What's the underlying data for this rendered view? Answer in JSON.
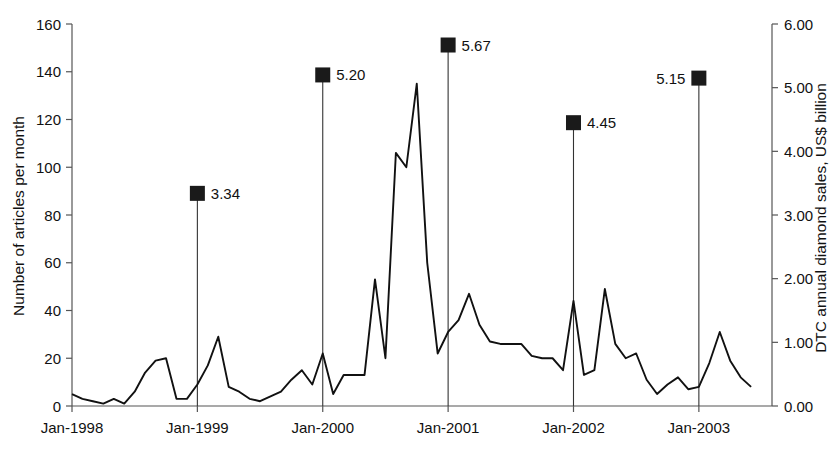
{
  "chart_data": {
    "type": "line",
    "title": "",
    "xlabel": "",
    "ylabel": "Number of articles per month",
    "y2label": "DTC annual diamond sales, US$ billion",
    "grid": false,
    "legend": "none",
    "xlim": [
      "Jan-1998",
      "Jul-2003"
    ],
    "ylim": [
      0,
      160
    ],
    "y2lim": [
      0,
      6.0
    ],
    "yticks": [
      0,
      20,
      40,
      60,
      80,
      100,
      120,
      140,
      160
    ],
    "ytick_labels": [
      "0",
      "20",
      "40",
      "60",
      "80",
      "100",
      "120",
      "140",
      "160"
    ],
    "y2ticks": [
      0.0,
      1.0,
      2.0,
      3.0,
      4.0,
      5.0,
      6.0
    ],
    "y2tick_labels": [
      "0.00",
      "1.00",
      "2.00",
      "3.00",
      "4.00",
      "5.00",
      "6.00"
    ],
    "xtick_labels": [
      "Jan-1998",
      "Jan-1999",
      "Jan-2000",
      "Jan-2001",
      "Jan-2002",
      "Jan-2003"
    ],
    "xtick_indices": [
      0,
      12,
      24,
      36,
      48,
      60
    ],
    "series": [
      {
        "name": "Number of articles per month",
        "axis": "left",
        "style": "line",
        "x": [
          "Jan-1998",
          "Feb-1998",
          "Mar-1998",
          "Apr-1998",
          "May-1998",
          "Jun-1998",
          "Jul-1998",
          "Aug-1998",
          "Sep-1998",
          "Oct-1998",
          "Nov-1998",
          "Dec-1998",
          "Jan-1999",
          "Feb-1999",
          "Mar-1999",
          "Apr-1999",
          "May-1999",
          "Jun-1999",
          "Jul-1999",
          "Aug-1999",
          "Sep-1999",
          "Oct-1999",
          "Nov-1999",
          "Dec-1999",
          "Jan-2000",
          "Feb-2000",
          "Mar-2000",
          "Apr-2000",
          "May-2000",
          "Jun-2000",
          "Jul-2000",
          "Aug-2000",
          "Sep-2000",
          "Oct-2000",
          "Nov-2000",
          "Dec-2000",
          "Jan-2001",
          "Feb-2001",
          "Mar-2001",
          "Apr-2001",
          "May-2001",
          "Jun-2001",
          "Jul-2001",
          "Aug-2001",
          "Sep-2001",
          "Oct-2001",
          "Nov-2001",
          "Dec-2001",
          "Jan-2002",
          "Feb-2002",
          "Mar-2002",
          "Apr-2002",
          "May-2002",
          "Jun-2002",
          "Jul-2002",
          "Aug-2002",
          "Sep-2002",
          "Oct-2002",
          "Nov-2002",
          "Dec-2002",
          "Jan-2003",
          "Feb-2003",
          "Mar-2003",
          "Apr-2003",
          "May-2003",
          "Jun-2003"
        ],
        "values": [
          5,
          3,
          2,
          1,
          3,
          1,
          6,
          14,
          19,
          20,
          3,
          3,
          9,
          17,
          29,
          8,
          6,
          3,
          2,
          4,
          6,
          11,
          15,
          9,
          22,
          5,
          13,
          13,
          13,
          53,
          20,
          106,
          100,
          135,
          60,
          22,
          31,
          36,
          47,
          34,
          27,
          26,
          26,
          26,
          21,
          20,
          20,
          15,
          44,
          13,
          15,
          49,
          26,
          20,
          22,
          11,
          5,
          9,
          12,
          7,
          8,
          18,
          31,
          19,
          12,
          8
        ]
      },
      {
        "name": "DTC annual diamond sales, US$ billion",
        "axis": "right",
        "style": "drop-line-marker",
        "points": [
          {
            "x": "Jan-1999",
            "label": "3.34",
            "value": 3.34,
            "label_side": "right"
          },
          {
            "x": "Jan-2000",
            "label": "5.20",
            "value": 5.2,
            "label_side": "right"
          },
          {
            "x": "Jan-2001",
            "label": "5.67",
            "value": 5.67,
            "label_side": "right"
          },
          {
            "x": "Jan-2002",
            "label": "4.45",
            "value": 4.45,
            "label_side": "right"
          },
          {
            "x": "Jan-2003",
            "label": "5.15",
            "value": 5.15,
            "label_side": "left"
          }
        ]
      }
    ]
  },
  "axes": {
    "left_title": "Number of articles per month",
    "right_title": "DTC annual diamond sales, US$ billion"
  }
}
